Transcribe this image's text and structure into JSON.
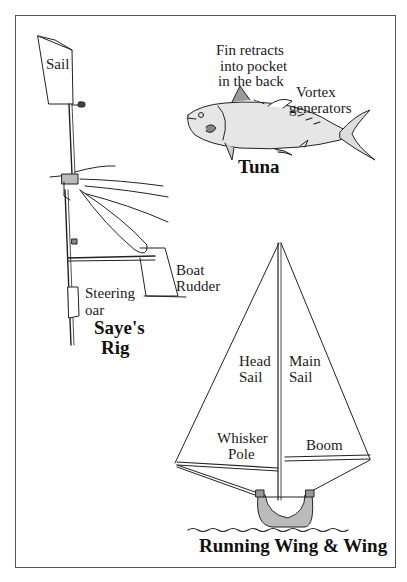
{
  "figure": {
    "panels": [
      {
        "id": "sayes-rig",
        "title_line1": "Saye's",
        "title_line2": "Rig",
        "labels": {
          "sail": "Sail",
          "boat_rudder_line1": "Boat",
          "boat_rudder_line2": "Rudder",
          "steering_oar_line1": "Steering",
          "steering_oar_line2": "oar"
        }
      },
      {
        "id": "tuna",
        "title": "Tuna",
        "labels": {
          "fin_line1": "Fin retracts",
          "fin_line2": "into pocket",
          "fin_line3": "in the back",
          "vortex_line1": "Vortex",
          "vortex_line2": "generators"
        }
      },
      {
        "id": "running-wing-and-wing",
        "title": "Running Wing & Wing",
        "labels": {
          "head_sail_line1": "Head",
          "head_sail_line2": "Sail",
          "main_sail_line1": "Main",
          "main_sail_line2": "Sail",
          "whisker_pole_line1": "Whisker",
          "whisker_pole_line2": "Pole",
          "boom": "Boom"
        }
      }
    ]
  }
}
